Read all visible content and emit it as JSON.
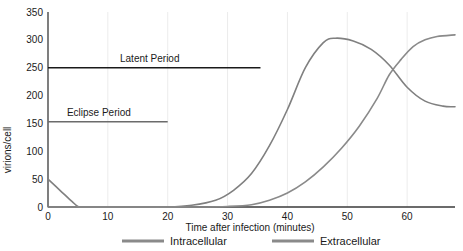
{
  "chart_data": {
    "type": "line",
    "title": "",
    "xlabel": "Time after infection (minutes)",
    "ylabel": "virions/cell",
    "xlim": [
      0,
      68
    ],
    "ylim": [
      0,
      350
    ],
    "xticks": [
      0,
      10,
      20,
      30,
      40,
      50,
      60
    ],
    "yticks": [
      0,
      50,
      100,
      150,
      200,
      250,
      300,
      350
    ],
    "grid": "vertical-faint",
    "legend_position": "bottom",
    "series": [
      {
        "name": "Intracellular",
        "color": "#808080",
        "x": [
          0,
          2,
          4,
          5,
          6,
          10,
          15,
          20,
          24,
          28,
          31,
          34,
          37,
          40,
          43,
          46,
          48,
          51,
          54,
          57,
          60,
          63,
          66,
          68
        ],
        "y": [
          50,
          30,
          10,
          1,
          0,
          0,
          0,
          0,
          3,
          12,
          30,
          60,
          110,
          175,
          250,
          295,
          303,
          298,
          283,
          255,
          215,
          190,
          181,
          180
        ]
      },
      {
        "name": "Extracellular",
        "color": "#8a8a8a",
        "x": [
          0,
          5,
          10,
          15,
          20,
          25,
          30,
          34,
          37,
          40,
          43,
          46,
          49,
          52,
          55,
          57,
          59,
          61,
          63,
          65,
          68
        ],
        "y": [
          0,
          0,
          0,
          0,
          0,
          0,
          1,
          4,
          12,
          25,
          45,
          72,
          105,
          145,
          195,
          237,
          265,
          288,
          300,
          306,
          309
        ]
      }
    ],
    "annotations": [
      {
        "label": "Latent Period",
        "y_value": 250,
        "x_start": 0,
        "x_end": 35.5,
        "color": "#1a1a1a",
        "label_x": 17,
        "label_above": true
      },
      {
        "label": "Eclipse Period",
        "y_value": 153,
        "x_start": 0,
        "x_end": 20,
        "color": "#6b6b6b",
        "label_x": 8.5,
        "label_above": true
      }
    ]
  },
  "legend": {
    "items": [
      {
        "label": "Intracellular",
        "color": "#8a8a8a"
      },
      {
        "label": "Extracellular",
        "color": "#8a8a8a"
      }
    ]
  },
  "axes": {
    "x_title": "Time after infection (minutes)",
    "y_title": "virions/cell",
    "x_tick_labels": [
      "0",
      "10",
      "20",
      "30",
      "40",
      "50",
      "60"
    ],
    "y_tick_labels": [
      "0",
      "50",
      "100",
      "150",
      "200",
      "250",
      "300",
      "350"
    ]
  },
  "colors": {
    "axis": "#3a3a3a",
    "grid": "#ececec",
    "intracellular": "#808080",
    "extracellular": "#8a8a8a",
    "latent_line": "#1a1a1a",
    "eclipse_line": "#6b6b6b",
    "text": "#1a1a1a"
  }
}
